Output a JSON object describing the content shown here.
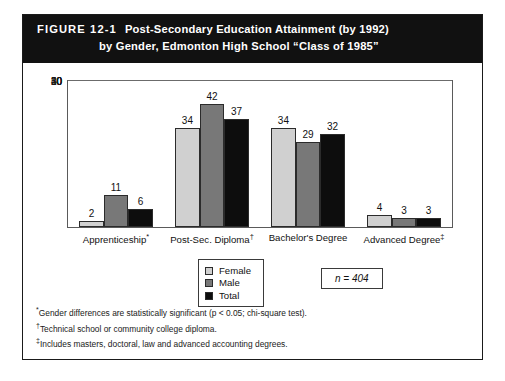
{
  "figure": {
    "label": "FIGURE 12-1",
    "title_line_1": "Post-Secondary Education Attainment (by 1992)",
    "title_line_2": "by Gender, Edmonton High School “Class of 1985”"
  },
  "annotation": {
    "n_text": "n = 404"
  },
  "footnotes": [
    "*Gender differences are statistically significant (p < 0.05; chi-square test).",
    "†Technical school or community college diploma.",
    "‡Includes masters, doctoral, law and advanced accounting degrees."
  ],
  "colors": {
    "female": "#d0d0d0",
    "male": "#787878",
    "total": "#0d0d0d",
    "banner": "#111111",
    "frame": "#1a1a1a",
    "grid": "#6b6b6b"
  },
  "chart_data": {
    "type": "bar",
    "title": "Post-Secondary Education Attainment (by 1992) by Gender, Edmonton High School “Class of 1985”",
    "xlabel": "",
    "ylabel": "",
    "ylim": [
      0,
      50
    ],
    "yticks": [
      0,
      10,
      20,
      30,
      40,
      50
    ],
    "ytick_labels": [
      "0",
      "10",
      "20",
      "30",
      "40",
      "50"
    ],
    "grid": true,
    "legend_position": "below-center",
    "categories": [
      "Apprenticeship*",
      "Post-Sec. Diploma†",
      "Bachelor's Degree",
      "Advanced Degree‡"
    ],
    "category_labels_plain": [
      "Apprenticeship",
      "Post-Sec. Diploma",
      "Bachelor's Degree",
      "Advanced Degree"
    ],
    "category_footnote_marks": [
      "*",
      "†",
      "",
      "‡"
    ],
    "series": [
      {
        "name": "Female",
        "color": "#d0d0d0",
        "values": [
          2,
          34,
          34,
          4
        ]
      },
      {
        "name": "Male",
        "color": "#787878",
        "values": [
          11,
          42,
          29,
          3
        ]
      },
      {
        "name": "Total",
        "color": "#0d0d0d",
        "values": [
          6,
          37,
          32,
          3
        ]
      }
    ],
    "annotations": [
      "n = 404"
    ]
  }
}
